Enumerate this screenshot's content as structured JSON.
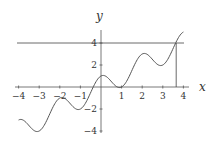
{
  "chart_data": {
    "type": "line",
    "title": "",
    "xlabel": "x",
    "ylabel": "y",
    "xlim": [
      -4,
      4
    ],
    "ylim": [
      -4,
      5
    ],
    "grid": false,
    "x_ticks": [
      "-4",
      "-3",
      "-2",
      "-1",
      "1",
      "2",
      "3",
      "4"
    ],
    "y_ticks": [
      "4",
      "2",
      "-2",
      "-4"
    ],
    "series": [
      {
        "name": "f(x)",
        "x": [
          -4,
          -3,
          -2,
          -1,
          0,
          1,
          2,
          3,
          4
        ],
        "values": [
          -3,
          -4,
          -1,
          -2,
          1,
          0,
          3,
          2,
          5
        ]
      }
    ],
    "annotations": [
      {
        "type": "horizontal_line",
        "y": 4
      },
      {
        "type": "vertical_line",
        "x": 3.65,
        "from_y": 0,
        "to_y": 4
      }
    ]
  }
}
